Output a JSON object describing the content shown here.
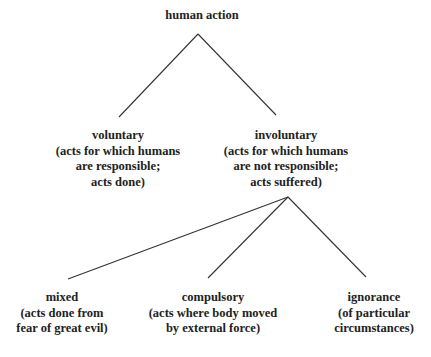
{
  "diagram": {
    "type": "tree",
    "root": {
      "label": "human action",
      "children": [
        {
          "label": "voluntary",
          "lines": [
            "(acts for which humans",
            "are responsible;",
            "acts done)"
          ]
        },
        {
          "label": "involuntary",
          "lines": [
            "(acts for which humans",
            "are not responsible;",
            "acts suffered)"
          ],
          "children": [
            {
              "label": "mixed",
              "lines": [
                "(acts done from",
                "fear of great evil)"
              ]
            },
            {
              "label": "compulsory",
              "lines": [
                "(acts where body moved",
                "by external force)"
              ]
            },
            {
              "label": "ignorance",
              "lines": [
                "(of particular",
                "circumstances)"
              ]
            }
          ]
        }
      ]
    },
    "edges": [
      [
        "human action",
        "voluntary"
      ],
      [
        "human action",
        "involuntary"
      ],
      [
        "involuntary",
        "mixed"
      ],
      [
        "involuntary",
        "compulsory"
      ],
      [
        "involuntary",
        "ignorance"
      ]
    ],
    "line_color": "#333333"
  }
}
